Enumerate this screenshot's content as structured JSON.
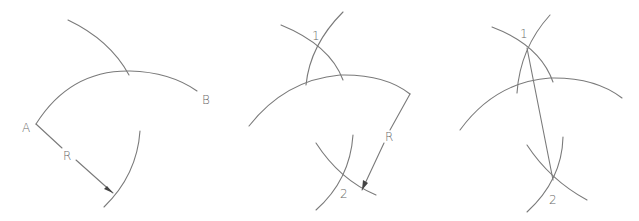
{
  "figure": {
    "line_color": "#7a7a7a",
    "label_color": "#6a6a6a",
    "background": "#ffffff"
  },
  "panels": [
    {
      "step": 1,
      "labels": {
        "point_a": "A",
        "point_b": "B",
        "radius": "R"
      }
    },
    {
      "step": 2,
      "labels": {
        "intersection_1": "1",
        "intersection_2": "2",
        "radius": "R"
      }
    },
    {
      "step": 3,
      "labels": {
        "intersection_1": "1",
        "intersection_2": "2"
      }
    }
  ]
}
